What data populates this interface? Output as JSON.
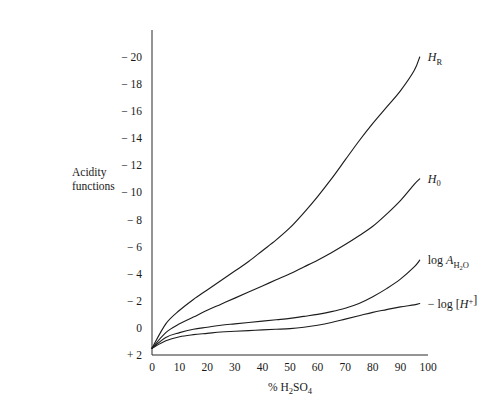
{
  "chart_data": {
    "type": "line",
    "title": "",
    "xlabel": "% H2SO4",
    "xlabel_html": "% H<sub>2</sub>SO<sub>4</sub>",
    "ylabel": "Acidity functions",
    "ylabel_line1": "Acidity",
    "ylabel_line2": "functions",
    "xlim": [
      0,
      100
    ],
    "ylim": [
      2,
      -20
    ],
    "y_axis_inverted": true,
    "grid": false,
    "legend_position": "inline-right-of-curve-ends",
    "xticks": [
      0,
      10,
      20,
      30,
      40,
      50,
      60,
      70,
      80,
      90,
      100
    ],
    "xtick_labels": [
      "0",
      "10",
      "20",
      "30",
      "40",
      "50",
      "60",
      "70",
      "80",
      "90",
      "100"
    ],
    "yticks": [
      2,
      0,
      -2,
      -4,
      -6,
      -8,
      -10,
      -12,
      -14,
      -16,
      -18,
      -20
    ],
    "ytick_labels": [
      "+ 2",
      "0",
      "− 2",
      "− 4",
      "− 6",
      "− 8",
      "− 10",
      "− 12",
      "− 14",
      "− 16",
      "− 18",
      "− 20"
    ],
    "x": [
      0,
      5,
      10,
      15,
      20,
      25,
      30,
      35,
      40,
      45,
      50,
      55,
      60,
      65,
      70,
      75,
      80,
      85,
      90,
      95,
      97
    ],
    "series": [
      {
        "name": "H_R",
        "label": "HR",
        "label_base": "H",
        "label_sub": "R",
        "values": [
          1.5,
          -0.3,
          -1.3,
          -2.1,
          -2.8,
          -3.5,
          -4.2,
          -4.9,
          -5.7,
          -6.5,
          -7.4,
          -8.5,
          -9.7,
          -11.0,
          -12.4,
          -13.8,
          -15.1,
          -16.3,
          -17.5,
          -19.0,
          -20.0
        ],
        "label_x": 97,
        "label_y": -20.3
      },
      {
        "name": "H_0",
        "label": "H0",
        "label_base": "H",
        "label_sub": "0",
        "values": [
          1.5,
          0.35,
          -0.3,
          -0.8,
          -1.3,
          -1.75,
          -2.2,
          -2.65,
          -3.1,
          -3.55,
          -4.0,
          -4.5,
          -5.0,
          -5.55,
          -6.15,
          -6.8,
          -7.5,
          -8.4,
          -9.4,
          -10.6,
          -11.0
        ],
        "label_x": 97,
        "label_y": -11.2
      },
      {
        "name": "log A_H2O",
        "label": "log AH2O",
        "label_prefix": "log ",
        "label_base": "A",
        "label_sub": "H2O",
        "values": [
          1.5,
          0.7,
          0.35,
          0.1,
          -0.05,
          -0.2,
          -0.3,
          -0.4,
          -0.5,
          -0.6,
          -0.7,
          -0.85,
          -1.0,
          -1.2,
          -1.45,
          -1.8,
          -2.3,
          -2.9,
          -3.6,
          -4.5,
          -5.0
        ],
        "label_x": 97,
        "label_y": -5.2
      },
      {
        "name": "-log [H+]",
        "label": "− log [H+]",
        "label_prefix": "− log [",
        "label_base": "H",
        "label_sup": "+",
        "label_suffix": "]",
        "values": [
          1.5,
          0.95,
          0.65,
          0.5,
          0.4,
          0.3,
          0.25,
          0.2,
          0.15,
          0.1,
          0.05,
          -0.05,
          -0.2,
          -0.4,
          -0.65,
          -0.9,
          -1.15,
          -1.35,
          -1.55,
          -1.7,
          -1.8
        ],
        "label_x": 97,
        "label_y": -1.6
      }
    ]
  },
  "colors": {
    "curve": "#1d1d1d",
    "axis": "#2a2a2a",
    "background": "#ffffff",
    "text": "#1a1a1a"
  }
}
